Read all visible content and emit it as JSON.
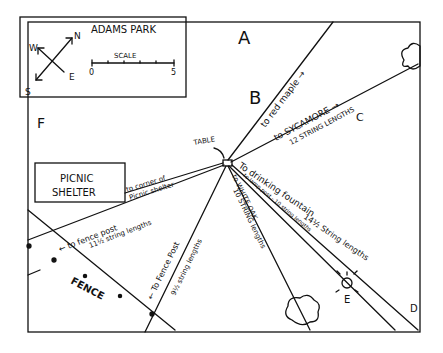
{
  "title": "ADAMS PARK",
  "legend": {
    "scale_label": "SCALE",
    "scale_start": "0",
    "scale_end": "5",
    "compass": {
      "n": "N",
      "s": "S",
      "e": "E",
      "w": "W"
    }
  },
  "points": {
    "a": "A",
    "b": "B",
    "c": "C",
    "d": "D",
    "e": "E",
    "f": "F"
  },
  "features": {
    "table": "TABLE",
    "shelter_line1": "PICNIC",
    "shelter_line2": "SHELTER",
    "fence": "FENCE"
  },
  "paths": [
    {
      "id": "red-maple",
      "label": "to red maple →"
    },
    {
      "id": "sycamore",
      "label": "to SYCAMORE →",
      "distance": "12 STRING LENGTHS"
    },
    {
      "id": "shelter-corner",
      "label": "to corner of",
      "label2": "Picnic shelter"
    },
    {
      "id": "fence-post-1",
      "label": "← to fence post",
      "distance": "11½ string lengths"
    },
    {
      "id": "fence-post-2",
      "label": "← To Fence Post",
      "distance": "9½ string lengths"
    },
    {
      "id": "white-oak",
      "label": "to WHITE OAK",
      "distance": "10 STRING lengths"
    },
    {
      "id": "lamp-post",
      "label": "to lamp post - 10 string lengths"
    },
    {
      "id": "drinking-fountain",
      "label": "To drinking fountain",
      "distance": "14½ String lengths"
    }
  ]
}
